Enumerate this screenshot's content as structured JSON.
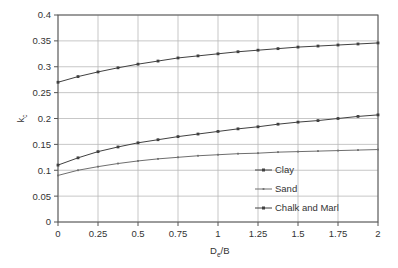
{
  "chart_data": {
    "type": "line",
    "title": "",
    "xlabel": "De/B",
    "xlabel_base": "D",
    "xlabel_sub": "e",
    "xlabel_tail": "/B",
    "ylabel": "kc",
    "ylabel_base": "k",
    "ylabel_sub": "c",
    "xlim": [
      0,
      2
    ],
    "ylim": [
      0,
      0.4
    ],
    "grid": true,
    "legend_position": "bottom-right",
    "x_ticks": [
      0,
      0.25,
      0.5,
      0.75,
      1,
      1.25,
      1.5,
      1.75,
      2
    ],
    "x_tick_labels": [
      "0",
      "0.25",
      "0.5",
      "0.75",
      "1",
      "1.25",
      "1.5",
      "1.75",
      "2"
    ],
    "y_ticks": [
      0,
      0.05,
      0.1,
      0.15,
      0.2,
      0.25,
      0.3,
      0.35,
      0.4
    ],
    "y_tick_labels": [
      "0",
      "0.05",
      "0.1",
      "0.15",
      "0.2",
      "0.25",
      "0.3",
      "0.35",
      "0.4"
    ],
    "x": [
      0,
      0.125,
      0.25,
      0.375,
      0.5,
      0.625,
      0.75,
      0.875,
      1,
      1.125,
      1.25,
      1.375,
      1.5,
      1.625,
      1.75,
      1.875,
      2
    ],
    "series": [
      {
        "name": "Clay",
        "color": "#404040",
        "values": [
          0.27,
          0.281,
          0.29,
          0.298,
          0.305,
          0.311,
          0.317,
          0.321,
          0.325,
          0.329,
          0.332,
          0.335,
          0.338,
          0.34,
          0.342,
          0.344,
          0.346
        ]
      },
      {
        "name": "Sand",
        "color": "#6e6e6e",
        "values": [
          0.09,
          0.1,
          0.107,
          0.113,
          0.118,
          0.122,
          0.125,
          0.128,
          0.13,
          0.132,
          0.133,
          0.135,
          0.136,
          0.137,
          0.138,
          0.139,
          0.14
        ]
      },
      {
        "name": "Chalk and Marl",
        "color": "#404040",
        "values": [
          0.11,
          0.124,
          0.136,
          0.145,
          0.153,
          0.159,
          0.165,
          0.17,
          0.175,
          0.18,
          0.184,
          0.189,
          0.193,
          0.196,
          0.2,
          0.204,
          0.207
        ]
      }
    ]
  },
  "legend": {
    "items": [
      {
        "label": "Clay"
      },
      {
        "label": "Sand"
      },
      {
        "label": "Chalk and Marl"
      }
    ]
  },
  "plot": {
    "left": 58,
    "right": 378,
    "top": 15,
    "bottom": 222
  }
}
